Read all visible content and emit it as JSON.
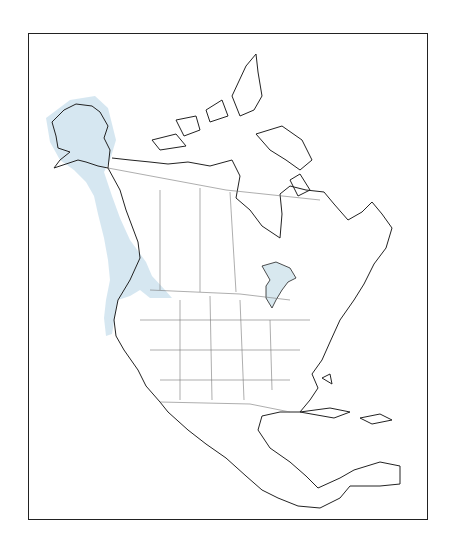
{
  "map": {
    "title": "",
    "region": "North America",
    "type": "species range map",
    "colors": {
      "range_fill": "#cfe3ee",
      "outline": "#222222",
      "internal_borders": "#777777",
      "frame": "#222222",
      "background": "#ffffff"
    },
    "highlighted_range": "Pacific coast from Alaska through British Columbia to northern California, inland to Idaho/Montana"
  }
}
